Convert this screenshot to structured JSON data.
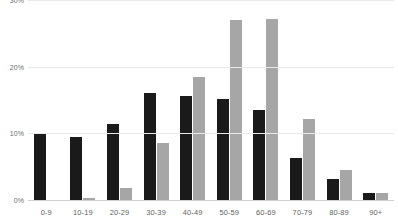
{
  "chart_data": {
    "type": "bar",
    "title": "",
    "xlabel": "",
    "ylabel": "",
    "categories": [
      "0-9",
      "10-19",
      "20-29",
      "30-39",
      "40-49",
      "50-59",
      "60-69",
      "70-79",
      "80-89",
      "90+"
    ],
    "series": [
      {
        "name": "series-1",
        "color": "#1a1a1a",
        "values": [
          9.9,
          9.4,
          11.4,
          16.0,
          15.6,
          15.1,
          13.5,
          6.3,
          3.2,
          1.0
        ]
      },
      {
        "name": "series-2",
        "color": "#a6a6a6",
        "values": [
          0.0,
          0.3,
          1.8,
          8.5,
          18.4,
          27.0,
          27.1,
          12.1,
          4.5,
          1.0
        ]
      }
    ],
    "ylim": [
      0,
      30
    ],
    "yticks": [
      0,
      10,
      20,
      30
    ],
    "ytick_labels": [
      "0%",
      "10%",
      "20%",
      "30%"
    ],
    "grid": true,
    "legend": "none",
    "value_suffix": "%"
  },
  "axis": {
    "y_labels": [
      "30%",
      "20%",
      "10%",
      "0%"
    ]
  }
}
